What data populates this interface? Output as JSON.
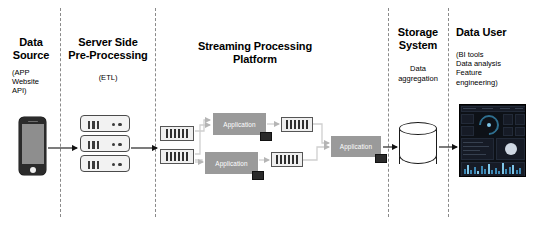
{
  "diagram": {
    "sections": [
      {
        "id": "data-source",
        "title": "Data\nSource",
        "title_line1": "Data",
        "title_line2": "Source",
        "subtitle": "(APP\nWebsite\nAPI)",
        "subtitle_line1": "(APP",
        "subtitle_line2": "Website",
        "subtitle_line3": "API)"
      },
      {
        "id": "server-side-pre-processing",
        "title_line1": "Server Side",
        "title_line2": "Pre-Processing",
        "subtitle_line1": "(ETL)"
      },
      {
        "id": "streaming-processing-platform",
        "title_line1": "Streaming Processing",
        "title_line2": "Platform"
      },
      {
        "id": "storage-system",
        "title_line1": "Storage",
        "title_line2": "System",
        "subtitle_line1": "Data",
        "subtitle_line2": "aggregation"
      },
      {
        "id": "data-user",
        "title_line1": "Data User",
        "subtitle_line1": "(BI tools",
        "subtitle_line2": "Data analysis",
        "subtitle_line3": "Feature",
        "subtitle_line4": "engineering)"
      }
    ],
    "nodes": {
      "app_box_label": "Application",
      "applications": [
        {
          "id": "application-top",
          "label": "Application"
        },
        {
          "id": "application-bottom",
          "label": "Application"
        },
        {
          "id": "application-final",
          "label": "Application"
        }
      ],
      "queues": [
        {
          "id": "queue-in-top"
        },
        {
          "id": "queue-in-bottom"
        },
        {
          "id": "queue-out-top"
        },
        {
          "id": "queue-out-bottom"
        }
      ],
      "queue_bar_count": 6,
      "server_unit_count": 3,
      "server_slot_count": 3,
      "server_dot_count": 2
    },
    "colors": {
      "background": "#ffffff",
      "divider": "#8a8a8a",
      "application_fill": "#9a9a9a",
      "application_text": "#ffffff",
      "queue_fill": "#efefef",
      "queue_bar": "#2f2f2f",
      "phone_body": "#2b2b2b",
      "phone_screen": "#8e8e8e",
      "server_fill": "#f2f2f2",
      "server_stroke": "#4a4a4a",
      "database_stroke": "#1a1a1a",
      "dashboard_background": "#0d1117",
      "arrow": "#111111",
      "wire": "#cfcfcf",
      "text": "#000000"
    }
  }
}
